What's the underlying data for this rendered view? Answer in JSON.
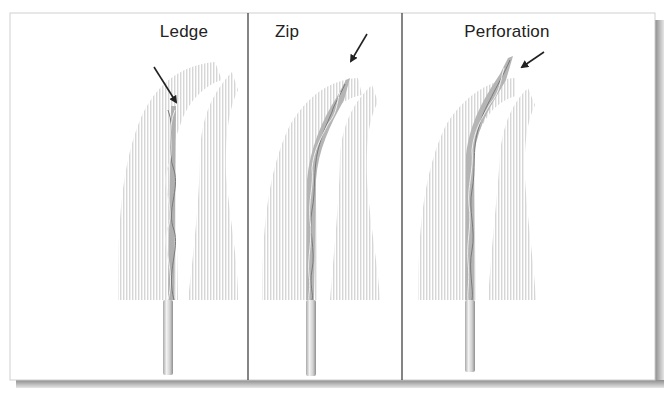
{
  "figure": {
    "type": "illustration",
    "panels": [
      {
        "label": "Ledge",
        "arrow": "points to file tip stopped short against canal wall (ledge)"
      },
      {
        "label": "Zip",
        "arrow": "points to transported apical end of canal (zip)"
      },
      {
        "label": "Perforation",
        "arrow": "points to file tip exiting root surface (perforation)"
      }
    ]
  },
  "colors": {
    "frame_border": "#c8c8c8",
    "divider": "#333333",
    "root_hatch": "#d9d9d9",
    "file_light": "#e8e8e8",
    "file_dark": "#8a8a8a",
    "arrow": "#222222",
    "shadow": "#9a9a9a"
  }
}
